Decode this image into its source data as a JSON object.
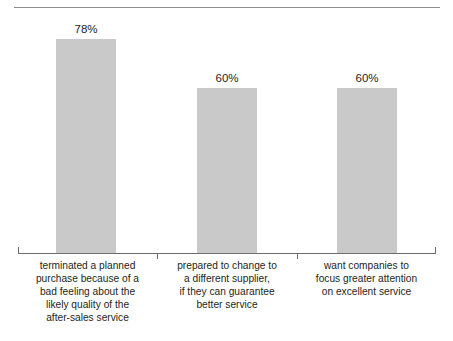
{
  "chart_data": {
    "type": "bar",
    "title": "",
    "subtitle": "",
    "xlabel": "",
    "ylabel": "",
    "ylim": [
      0,
      87
    ],
    "grid": false,
    "legend": "none",
    "value_suffix": "%",
    "categories": [
      "terminated a planned purchase because of a bad feeling about the likely quality of the after-sales service",
      "prepared to change to a different supplier, if they can guarantee better service",
      "want companies to focus greater attention on excellent service"
    ],
    "category_lines": [
      [
        "terminated a planned",
        "purchase because of a",
        "bad feeling about the",
        "likely quality of the",
        "after-sales service"
      ],
      [
        "prepared to change to",
        "a different supplier,",
        "if they can guarantee",
        "better service"
      ],
      [
        "want companies to",
        "focus greater attention",
        "on excellent service"
      ]
    ],
    "values": [
      78,
      60,
      60
    ],
    "value_labels": [
      "78%",
      "60%",
      "60%"
    ],
    "colors": {
      "bar_fill": "#c9c9c9",
      "axis": "#6d6d6d",
      "top_rule": "#8e8e8e",
      "text": "#231f20",
      "background": "#ffffff"
    }
  }
}
